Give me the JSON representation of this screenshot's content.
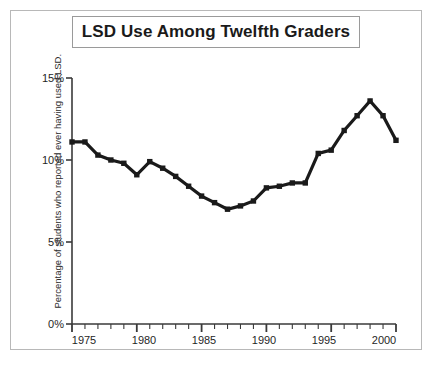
{
  "chart_data": {
    "type": "line",
    "title": "LSD Use Among Twelfth Graders",
    "xlabel": "",
    "ylabel": "Percentage of students who reported ever having used LSD.",
    "xlim": [
      1975,
      2000
    ],
    "ylim": [
      0,
      15
    ],
    "ytick_labels": [
      "15%",
      "10%",
      "5%",
      "0%"
    ],
    "ytick_values": [
      15,
      10,
      5,
      0
    ],
    "xtick_labels": [
      "1975",
      "1980",
      "1985",
      "1990",
      "1995",
      "2000"
    ],
    "xtick_values": [
      1975,
      1980,
      1985,
      1990,
      1995,
      2000
    ],
    "grid": false,
    "legend": "none",
    "marker": "square",
    "line_color": "#1a1a1a",
    "x": [
      1975,
      1976,
      1977,
      1978,
      1979,
      1980,
      1981,
      1982,
      1983,
      1984,
      1985,
      1986,
      1987,
      1988,
      1989,
      1990,
      1991,
      1992,
      1993,
      1994,
      1995,
      1996,
      1997,
      1998,
      1999,
      2000
    ],
    "values": [
      11.1,
      11.1,
      10.3,
      10.0,
      9.8,
      9.1,
      9.9,
      9.5,
      9.0,
      8.4,
      7.8,
      7.4,
      7.0,
      7.2,
      7.5,
      8.3,
      8.4,
      8.6,
      8.6,
      10.4,
      10.6,
      11.8,
      12.7,
      13.6,
      12.7,
      11.2
    ]
  },
  "frame": {
    "border_color": "#b8b8b8"
  }
}
